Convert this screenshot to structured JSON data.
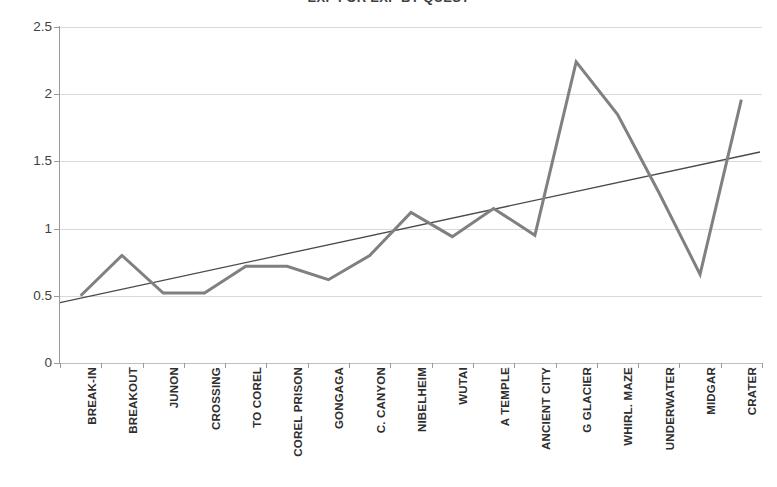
{
  "chart_data": {
    "type": "line",
    "title": "EXP FOR EXP BY QUEST",
    "xlabel": "",
    "ylabel": "",
    "ylim": [
      0,
      2.5
    ],
    "ytick_labels": [
      "0",
      "0.5",
      "1",
      "1.5",
      "2",
      "2.5"
    ],
    "ytick_values": [
      0,
      0.5,
      1,
      1.5,
      2,
      2.5
    ],
    "grid": true,
    "legend": "none",
    "categories": [
      "BREAK-IN",
      "BREAKOUT",
      "JUNON",
      "CROSSING",
      "TO COREL",
      "COREL PRISON",
      "GONGAGA",
      "C. CANYON",
      "NIBELHEIM",
      "WUTAI",
      "A TEMPLE",
      "ANCIENT CITY",
      "G GLACIER",
      "WHIRL. MAZE",
      "UNDERWATER",
      "MIDGAR",
      "CRATER"
    ],
    "series": [
      {
        "name": "EXP ratio",
        "color": "#808080",
        "values": [
          0.5,
          0.8,
          0.52,
          0.52,
          0.72,
          0.72,
          0.62,
          0.8,
          1.12,
          0.94,
          1.15,
          0.95,
          2.24,
          1.85,
          1.27,
          0.66,
          1.96
        ]
      },
      {
        "name": "Linear trendline",
        "color": "#4a4a4a",
        "trend": true,
        "endpoints": [
          0.45,
          1.57
        ]
      }
    ]
  },
  "axis_colors": {
    "gridline": "#d9d9d9",
    "axis": "#9a9a9a",
    "series": "#808080",
    "trendline": "#4a4a4a",
    "text": "#3f3f3f"
  }
}
